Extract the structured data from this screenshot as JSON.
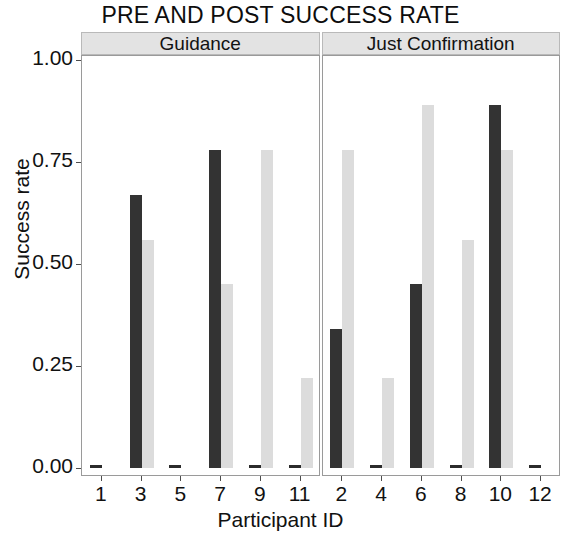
{
  "chart_data": {
    "type": "bar",
    "title": "PRE AND POST SUCCESS RATE",
    "xlabel": "Participant ID",
    "ylabel": "Success rate",
    "ylim": [
      0,
      1.0
    ],
    "yticks": [
      "0.00",
      "0.25",
      "0.50",
      "0.75",
      "1.00"
    ],
    "ytick_values": [
      0,
      0.25,
      0.5,
      0.75,
      1.0
    ],
    "grid": false,
    "legend": "none",
    "facet_variable": "Condition",
    "series": [
      {
        "name": "Pre",
        "color": "#333333"
      },
      {
        "name": "Post",
        "color": "#dcdcdc"
      }
    ],
    "panels": [
      {
        "label": "Guidance",
        "categories": [
          "1",
          "3",
          "5",
          "7",
          "9",
          "11"
        ],
        "series": [
          {
            "name": "Pre",
            "values": [
              0.0,
              0.67,
              0.0,
              0.78,
              0.0,
              0.0
            ]
          },
          {
            "name": "Post",
            "values": [
              0.0,
              0.56,
              0.0,
              0.45,
              0.78,
              0.22
            ]
          }
        ]
      },
      {
        "label": "Just Confirmation",
        "categories": [
          "2",
          "4",
          "6",
          "8",
          "10",
          "12"
        ],
        "series": [
          {
            "name": "Pre",
            "values": [
              0.34,
              0.0,
              0.45,
              0.0,
              0.89,
              0.0
            ]
          },
          {
            "name": "Post",
            "values": [
              0.78,
              0.22,
              0.89,
              0.56,
              0.78,
              0.0
            ]
          }
        ]
      }
    ]
  }
}
